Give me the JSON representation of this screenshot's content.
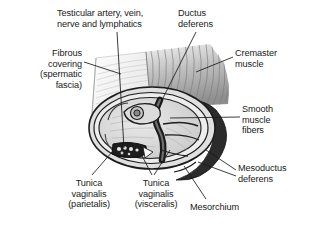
{
  "figure": {
    "background_color": "#ffffff",
    "line_color": "#1a1a1a",
    "colors": {
      "dark_band": "#2a2a2a",
      "mid_gray": "#8d8d8d",
      "light_gray": "#c9c9c9",
      "pale_gray": "#e3e3e3",
      "hatch_gray": "#b0b0b0",
      "text": "#1a1a1a"
    }
  },
  "labels": {
    "testicular_vessels": "Testicular artery, vein,\nnerve and lymphatics",
    "ductus_deferens": "Ductus\ndeferens",
    "fibrous_covering": "Fibrous\ncovering\n(spermatic\nfascia)",
    "cremaster_muscle": "Cremaster\nmuscle",
    "smooth_muscle_fibers": "Smooth\nmuscle\nfibers",
    "mesoductus_deferens": "Mesoductus\ndeferens",
    "tunica_vaginalis_parietalis": "Tunica\nvaginalis\n(parietalis)",
    "tunica_vaginalis_visceralis": "Tunica\nvaginalis\n(visceralis)",
    "mesorchium": "Mesorchium"
  }
}
